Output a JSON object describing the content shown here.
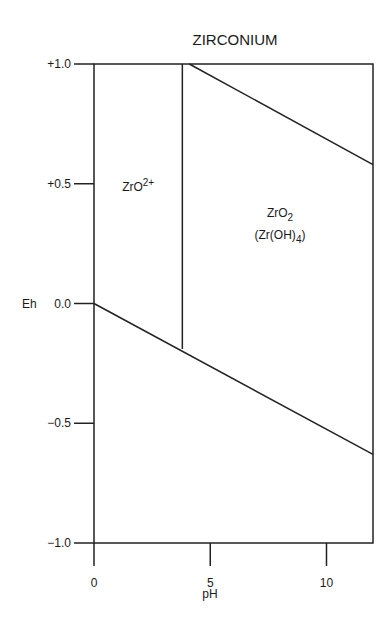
{
  "chart_data": {
    "type": "line",
    "title": "ZIRCONIUM",
    "xlabel": "pH",
    "ylabel": "Eh",
    "xlim": [
      0,
      12
    ],
    "ylim": [
      -1.0,
      1.0
    ],
    "x_ticks": [
      0,
      5,
      10
    ],
    "x_tick_labels": [
      "0",
      "5",
      "10"
    ],
    "y_ticks": [
      1.0,
      0.5,
      0.0,
      -0.5,
      -1.0
    ],
    "y_tick_labels": [
      "+1.0",
      "+0.5",
      "0.0",
      "−0.5",
      "−1.0"
    ],
    "grid": false,
    "legend": null,
    "series": [
      {
        "name": "lower-boundary",
        "x": [
          0,
          12
        ],
        "y": [
          0.0,
          -0.63
        ]
      },
      {
        "name": "ZrO2+/ZrO2-boundary",
        "x": [
          3.8,
          3.8
        ],
        "y": [
          1.0,
          -0.19
        ]
      },
      {
        "name": "upper-boundary",
        "x": [
          4.1,
          12
        ],
        "y": [
          1.0,
          0.58
        ]
      }
    ],
    "regions": [
      {
        "label": "ZrO",
        "superscript": "2+",
        "x": 1.9,
        "y": 0.47
      },
      {
        "label": "ZrO",
        "subscript": "2",
        "line2": "(Zr(OH)",
        "line2_subscript": "4",
        "line2_suffix": ")",
        "x": 8.0,
        "y": 0.36
      }
    ]
  }
}
